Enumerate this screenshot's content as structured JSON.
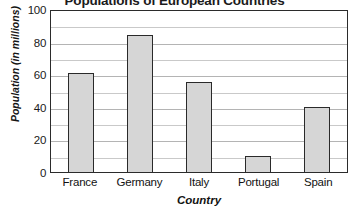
{
  "chart_data": {
    "type": "bar",
    "title": "Populations of European Countries",
    "xlabel": "Country",
    "ylabel": "Population (in millions)",
    "categories": [
      "France",
      "Germany",
      "Italy",
      "Portugal",
      "Spain"
    ],
    "values": [
      61,
      84,
      55,
      10,
      40
    ],
    "ylim": [
      0,
      100
    ],
    "yticks": [
      0,
      20,
      40,
      60,
      80,
      100
    ],
    "ytick_labels": [
      "0",
      "20",
      "40",
      "60",
      "80",
      "100"
    ],
    "gridlines": [
      0,
      10,
      20,
      30,
      40,
      50,
      60,
      70,
      80,
      90,
      100
    ],
    "grid": true,
    "legend": "none",
    "colors": {
      "bar_fill": "#d6d6d6",
      "bar_border": "#2a2a2a",
      "gridline": "#c9c9c9",
      "axis": "#2b2b2b",
      "text": "#121212",
      "background": "#ffffff"
    }
  }
}
